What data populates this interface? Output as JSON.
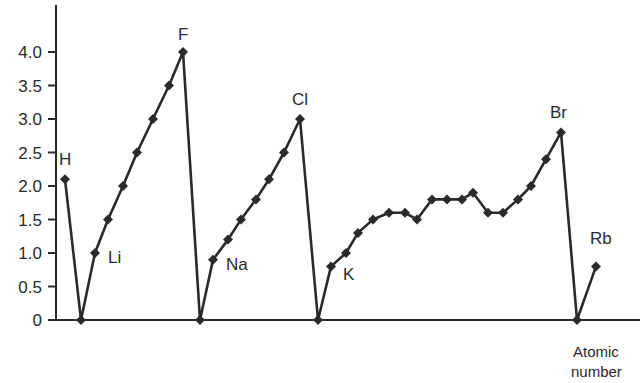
{
  "chart_data": {
    "type": "line",
    "title": "",
    "xlabel": "Atomic number",
    "ylabel": "",
    "ylim": [
      0,
      4.0
    ],
    "yticks": [
      "0",
      "0.5",
      "1.0",
      "1.5",
      "2.0",
      "2.5",
      "3.0",
      "3.5",
      "4.0"
    ],
    "grid": false,
    "legend": null,
    "marker": "diamond",
    "line_color": "#2a2a2a",
    "labeled_points": [
      "H",
      "Li",
      "F",
      "Na",
      "Cl",
      "K",
      "Br",
      "Rb"
    ],
    "series": [
      {
        "name": "Electronegativity",
        "points": [
          {
            "el": "H",
            "x": 65,
            "y": 2.1
          },
          {
            "el": "He",
            "x": 81,
            "y": 0
          },
          {
            "el": "Li",
            "x": 95,
            "y": 1.0
          },
          {
            "el": "Be",
            "x": 108,
            "y": 1.5
          },
          {
            "el": "B",
            "x": 123,
            "y": 2.0
          },
          {
            "el": "C",
            "x": 137,
            "y": 2.5
          },
          {
            "el": "N",
            "x": 153,
            "y": 3.0
          },
          {
            "el": "O",
            "x": 169,
            "y": 3.5
          },
          {
            "el": "F",
            "x": 183,
            "y": 4.0
          },
          {
            "el": "Ne",
            "x": 200,
            "y": 0
          },
          {
            "el": "Na",
            "x": 213,
            "y": 0.9
          },
          {
            "el": "Mg",
            "x": 228,
            "y": 1.2
          },
          {
            "el": "Al",
            "x": 241,
            "y": 1.5
          },
          {
            "el": "Si",
            "x": 256,
            "y": 1.8
          },
          {
            "el": "P",
            "x": 269,
            "y": 2.1
          },
          {
            "el": "S",
            "x": 284,
            "y": 2.5
          },
          {
            "el": "Cl",
            "x": 300,
            "y": 3.0
          },
          {
            "el": "Ar",
            "x": 318,
            "y": 0
          },
          {
            "el": "K",
            "x": 331,
            "y": 0.8
          },
          {
            "el": "Ca",
            "x": 346,
            "y": 1.0
          },
          {
            "el": "Sc",
            "x": 358,
            "y": 1.3
          },
          {
            "el": "Ti",
            "x": 373,
            "y": 1.5
          },
          {
            "el": "V",
            "x": 389,
            "y": 1.6
          },
          {
            "el": "Cr",
            "x": 405,
            "y": 1.6
          },
          {
            "el": "Mn",
            "x": 417,
            "y": 1.5
          },
          {
            "el": "Fe",
            "x": 432,
            "y": 1.8
          },
          {
            "el": "Co",
            "x": 447,
            "y": 1.8
          },
          {
            "el": "Ni",
            "x": 462,
            "y": 1.8
          },
          {
            "el": "Cu",
            "x": 473,
            "y": 1.9
          },
          {
            "el": "Zn",
            "x": 488,
            "y": 1.6
          },
          {
            "el": "Ga",
            "x": 503,
            "y": 1.6
          },
          {
            "el": "Ge",
            "x": 518,
            "y": 1.8
          },
          {
            "el": "As",
            "x": 531,
            "y": 2.0
          },
          {
            "el": "Se",
            "x": 546,
            "y": 2.4
          },
          {
            "el": "Br",
            "x": 561,
            "y": 2.8
          },
          {
            "el": "Kr",
            "x": 577,
            "y": 0
          },
          {
            "el": "Rb",
            "x": 596,
            "y": 0.8
          }
        ]
      }
    ]
  },
  "labels": {
    "H": {
      "text": "H",
      "dx": -6,
      "dy": -14
    },
    "Li": {
      "text": "Li",
      "dx": 13,
      "dy": 10
    },
    "F": {
      "text": "F",
      "dx": -5,
      "dy": -12
    },
    "Na": {
      "text": "Na",
      "dx": 13,
      "dy": 10
    },
    "Cl": {
      "text": "Cl",
      "dx": -8,
      "dy": -14
    },
    "K": {
      "text": "K",
      "dx": 12,
      "dy": 14
    },
    "Br": {
      "text": "Br",
      "dx": -11,
      "dy": -14
    },
    "Rb": {
      "text": "Rb",
      "dx": -6,
      "dy": -22
    }
  },
  "axis": {
    "x_label_line1": "Atomic",
    "x_label_line2": "number"
  }
}
